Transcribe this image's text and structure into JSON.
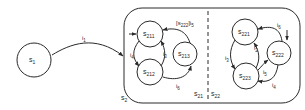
{
  "diagram": {
    "type": "statechart",
    "colors": {
      "ink": "#2a2a2a",
      "background": "#ffffff"
    },
    "states": {
      "s1": {
        "base": "s",
        "sub": "1"
      },
      "s2": {
        "base": "s",
        "sub": "2"
      },
      "s21": {
        "base": "s",
        "sub": "21"
      },
      "s22": {
        "base": "s",
        "sub": "22"
      },
      "s211": {
        "base": "s",
        "sub": "211"
      },
      "s212": {
        "base": "s",
        "sub": "212"
      },
      "s213": {
        "base": "s",
        "sub": "213"
      },
      "s221": {
        "base": "s",
        "sub": "221"
      },
      "s222": {
        "base": "s",
        "sub": "222"
      },
      "s223": {
        "base": "s",
        "sub": "223"
      }
    },
    "transitions": [
      {
        "id": "t1",
        "from": "s1",
        "to": "s2",
        "label_base": "i",
        "label_sub": "1"
      },
      {
        "id": "t4",
        "from": "s211",
        "to": "s212",
        "label_base": "i",
        "label_sub": "4"
      },
      {
        "id": "t3a",
        "from": "s212",
        "to": "s211",
        "label_base": "i",
        "label_sub": "3"
      },
      {
        "id": "t6a",
        "from": "s212",
        "to": "s213",
        "label_base": "i",
        "label_sub": "6"
      },
      {
        "id": "tguard",
        "from": "s213",
        "to": "s211",
        "label_guard": "[s222]",
        "guard_base": "s",
        "guard_sub": "222",
        "label_base": "i",
        "label_sub": "5"
      },
      {
        "id": "t6b",
        "from": "s222",
        "to": "s221",
        "label_base": "i",
        "label_sub": "6"
      },
      {
        "id": "t2",
        "from": "s223",
        "to": "s221",
        "label_base": "i",
        "label_sub": "2"
      },
      {
        "id": "t3b",
        "from": "s221",
        "to": "s223",
        "label_base": "i",
        "label_sub": "3"
      },
      {
        "id": "t5",
        "from": "s223",
        "to": "s222",
        "label_base": "i",
        "label_sub": "5"
      },
      {
        "id": "t4b",
        "from": "s222",
        "to": "s223",
        "label_base": "i",
        "label_sub": "4"
      }
    ],
    "defaults": [
      "s211",
      "s222"
    ],
    "guard_text": {
      "open": "[",
      "close": "]"
    }
  }
}
